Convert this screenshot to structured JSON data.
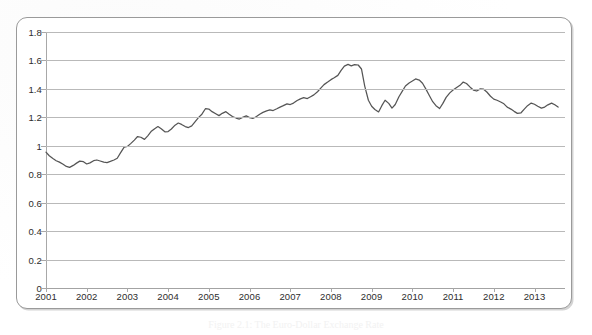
{
  "figure": {
    "caption": "Figure 2.1: The Euro-Dollar Exchange Rate",
    "line_color": "#555555",
    "grid_color": "#b9b9b9",
    "frame_color": "#9a9a9a",
    "background_color": "#ffffff"
  },
  "chart_data": {
    "type": "line",
    "title": "",
    "subtitle": "",
    "xlabel": "",
    "ylabel": "",
    "xlim": [
      2001,
      2013.75
    ],
    "ylim": [
      0,
      1.8
    ],
    "grid": true,
    "grid_axis": "y",
    "legend": false,
    "legend_position": "none",
    "x_tick_labels": [
      "2001",
      "2002",
      "2003",
      "2004",
      "2005",
      "2006",
      "2007",
      "2008",
      "2009",
      "2010",
      "2011",
      "2012",
      "2013"
    ],
    "x_ticks": [
      2001,
      2002,
      2003,
      2004,
      2005,
      2006,
      2007,
      2008,
      2009,
      2010,
      2011,
      2012,
      2013
    ],
    "y_tick_labels": [
      "0",
      "0.2",
      "0.4",
      "0.6",
      "0.8",
      "1",
      "1.2",
      "1.4",
      "1.6",
      "1.8"
    ],
    "y_ticks": [
      0,
      0.2,
      0.4,
      0.6,
      0.8,
      1,
      1.2,
      1.4,
      1.6,
      1.8
    ],
    "series": [
      {
        "name": "Euro-Dollar exchange rate",
        "color": "#555555",
        "x": [
          2001.0,
          2001.08,
          2001.17,
          2001.25,
          2001.33,
          2001.42,
          2001.5,
          2001.58,
          2001.67,
          2001.75,
          2001.83,
          2001.92,
          2002.0,
          2002.08,
          2002.17,
          2002.25,
          2002.33,
          2002.42,
          2002.5,
          2002.58,
          2002.67,
          2002.75,
          2002.83,
          2002.92,
          2003.0,
          2003.08,
          2003.17,
          2003.25,
          2003.33,
          2003.42,
          2003.5,
          2003.58,
          2003.67,
          2003.75,
          2003.83,
          2003.92,
          2004.0,
          2004.08,
          2004.17,
          2004.25,
          2004.33,
          2004.42,
          2004.5,
          2004.58,
          2004.67,
          2004.75,
          2004.83,
          2004.92,
          2005.0,
          2005.08,
          2005.17,
          2005.25,
          2005.33,
          2005.42,
          2005.5,
          2005.58,
          2005.67,
          2005.75,
          2005.83,
          2005.92,
          2006.0,
          2006.08,
          2006.17,
          2006.25,
          2006.33,
          2006.42,
          2006.5,
          2006.58,
          2006.67,
          2006.75,
          2006.83,
          2006.92,
          2007.0,
          2007.08,
          2007.17,
          2007.25,
          2007.33,
          2007.42,
          2007.5,
          2007.58,
          2007.67,
          2007.75,
          2007.83,
          2007.92,
          2008.0,
          2008.08,
          2008.17,
          2008.25,
          2008.33,
          2008.42,
          2008.5,
          2008.58,
          2008.67,
          2008.75,
          2008.83,
          2008.92,
          2009.0,
          2009.08,
          2009.17,
          2009.25,
          2009.33,
          2009.42,
          2009.5,
          2009.58,
          2009.67,
          2009.75,
          2009.83,
          2009.92,
          2010.0,
          2010.08,
          2010.17,
          2010.25,
          2010.33,
          2010.42,
          2010.5,
          2010.58,
          2010.67,
          2010.75,
          2010.83,
          2010.92,
          2011.0,
          2011.08,
          2011.17,
          2011.25,
          2011.33,
          2011.42,
          2011.5,
          2011.58,
          2011.67,
          2011.75,
          2011.83,
          2011.92,
          2012.0,
          2012.08,
          2012.17,
          2012.25,
          2012.33,
          2012.42,
          2012.5,
          2012.58,
          2012.67,
          2012.75,
          2012.83,
          2012.92,
          2013.0,
          2013.08,
          2013.17,
          2013.25,
          2013.33,
          2013.42,
          2013.5,
          2013.58
        ],
        "y": [
          0.955,
          0.93,
          0.91,
          0.895,
          0.885,
          0.87,
          0.855,
          0.848,
          0.862,
          0.878,
          0.892,
          0.888,
          0.872,
          0.88,
          0.895,
          0.9,
          0.893,
          0.885,
          0.882,
          0.89,
          0.9,
          0.912,
          0.95,
          0.99,
          0.995,
          1.015,
          1.04,
          1.065,
          1.06,
          1.045,
          1.07,
          1.1,
          1.12,
          1.135,
          1.12,
          1.098,
          1.1,
          1.118,
          1.145,
          1.16,
          1.15,
          1.135,
          1.128,
          1.14,
          1.172,
          1.2,
          1.222,
          1.262,
          1.258,
          1.24,
          1.225,
          1.212,
          1.228,
          1.24,
          1.222,
          1.205,
          1.195,
          1.188,
          1.2,
          1.21,
          1.198,
          1.192,
          1.205,
          1.222,
          1.235,
          1.245,
          1.252,
          1.248,
          1.26,
          1.272,
          1.282,
          1.295,
          1.29,
          1.3,
          1.318,
          1.33,
          1.338,
          1.332,
          1.345,
          1.358,
          1.38,
          1.405,
          1.43,
          1.448,
          1.465,
          1.478,
          1.495,
          1.53,
          1.56,
          1.572,
          1.562,
          1.57,
          1.568,
          1.54,
          1.42,
          1.32,
          1.278,
          1.255,
          1.238,
          1.282,
          1.32,
          1.298,
          1.265,
          1.29,
          1.345,
          1.382,
          1.42,
          1.442,
          1.455,
          1.47,
          1.462,
          1.44,
          1.4,
          1.352,
          1.31,
          1.282,
          1.262,
          1.298,
          1.34,
          1.372,
          1.392,
          1.408,
          1.425,
          1.448,
          1.438,
          1.412,
          1.392,
          1.385,
          1.4,
          1.398,
          1.378,
          1.348,
          1.328,
          1.32,
          1.308,
          1.295,
          1.272,
          1.258,
          1.242,
          1.228,
          1.232,
          1.258,
          1.282,
          1.3,
          1.292,
          1.278,
          1.265,
          1.272,
          1.288,
          1.3,
          1.288,
          1.272
        ]
      }
    ]
  }
}
